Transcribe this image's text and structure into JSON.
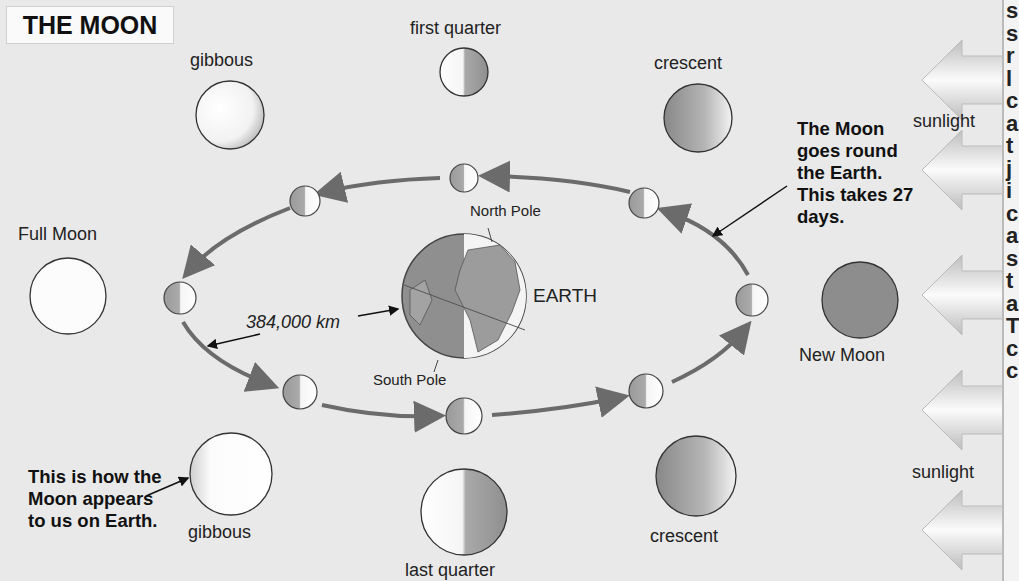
{
  "title": "THE MOON",
  "labels": {
    "first_quarter": "first quarter",
    "last_quarter": "last quarter",
    "gibbous_top": "gibbous",
    "gibbous_bottom": "gibbous",
    "crescent_top": "crescent",
    "crescent_bottom": "crescent",
    "full_moon": "Full Moon",
    "new_moon": "New Moon",
    "north_pole": "North Pole",
    "south_pole": "South Pole",
    "earth": "EARTH",
    "distance": "384,000 km",
    "sunlight_top": "sunlight",
    "sunlight_bottom": "sunlight"
  },
  "annotations": {
    "orbit_note": "The Moon goes round the Earth. This takes 27 days.",
    "appearance_note": "This is how the Moon appears to us on Earth."
  },
  "sidebar_letters": [
    "s",
    "s",
    "r",
    "l",
    "c",
    "a",
    "t",
    "j",
    "i",
    "c",
    "a",
    "s",
    "t",
    "a",
    "T",
    "c",
    "c"
  ],
  "colors": {
    "background": "#e9e9e9",
    "arrow": "#6b6b6b",
    "new_moon": "#8a8a8a"
  }
}
